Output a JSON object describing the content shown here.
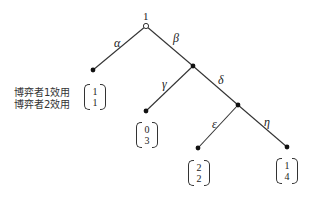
{
  "diagram": {
    "type": "extensive-form game tree",
    "root": {
      "label": "1",
      "player": "1"
    },
    "actions": {
      "alpha": "α",
      "beta": "β",
      "gamma": "γ",
      "delta": "δ",
      "epsilon": "ε",
      "eta": "η"
    },
    "legend": {
      "player1_utility": "博弈者1效用",
      "player2_utility": "博弈者2效用"
    },
    "payoffs": {
      "alpha": {
        "p1": "1",
        "p2": "1"
      },
      "gamma": {
        "p1": "0",
        "p2": "3"
      },
      "epsilon": {
        "p1": "2",
        "p2": "2"
      },
      "eta": {
        "p1": "1",
        "p2": "4"
      }
    },
    "colors": {
      "line": "#333333",
      "node": "#111111",
      "background": "#ffffff"
    }
  }
}
